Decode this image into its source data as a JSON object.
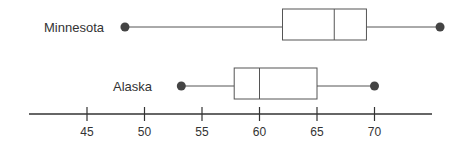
{
  "chart_data": {
    "type": "boxplot",
    "title": "",
    "xlabel": "",
    "ylabel": "",
    "orientation": "horizontal",
    "axis": {
      "ticks": [
        45,
        50,
        55,
        60,
        65,
        70
      ],
      "tick_labels": [
        "45",
        "50",
        "55",
        "60",
        "65",
        "70"
      ],
      "range": [
        41,
        76.5
      ],
      "grid": false
    },
    "series": [
      {
        "name": "Minnesota",
        "min": 48.3,
        "q1": 62,
        "median": 66.5,
        "q3": 69.3,
        "max": 75.7
      },
      {
        "name": "Alaska",
        "min": 53.2,
        "q1": 57.8,
        "median": 60,
        "q3": 65,
        "max": 70
      }
    ],
    "colors": {
      "line": "#555555",
      "dot": "#444444",
      "axis": "#333333"
    }
  }
}
